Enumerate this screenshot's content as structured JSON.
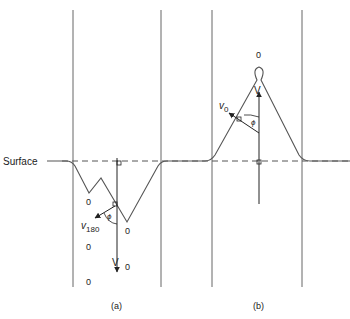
{
  "figure": {
    "surface_label": "Surface",
    "panel_a": {
      "caption": "(a)",
      "zero_labels": [
        "0",
        "0",
        "0",
        "0"
      ],
      "velocity_label": "V",
      "velocity_subscript": "0",
      "v_label": "v",
      "v_subscript": "180",
      "angle_label": "ϕ"
    },
    "panel_b": {
      "caption": "(b)",
      "apex_label": "0",
      "velocity_label": "V",
      "v_label": "v",
      "v_subscript": "0",
      "angle_label": "ϕ"
    },
    "colors": {
      "line": "#555555",
      "text": "#222222"
    }
  }
}
